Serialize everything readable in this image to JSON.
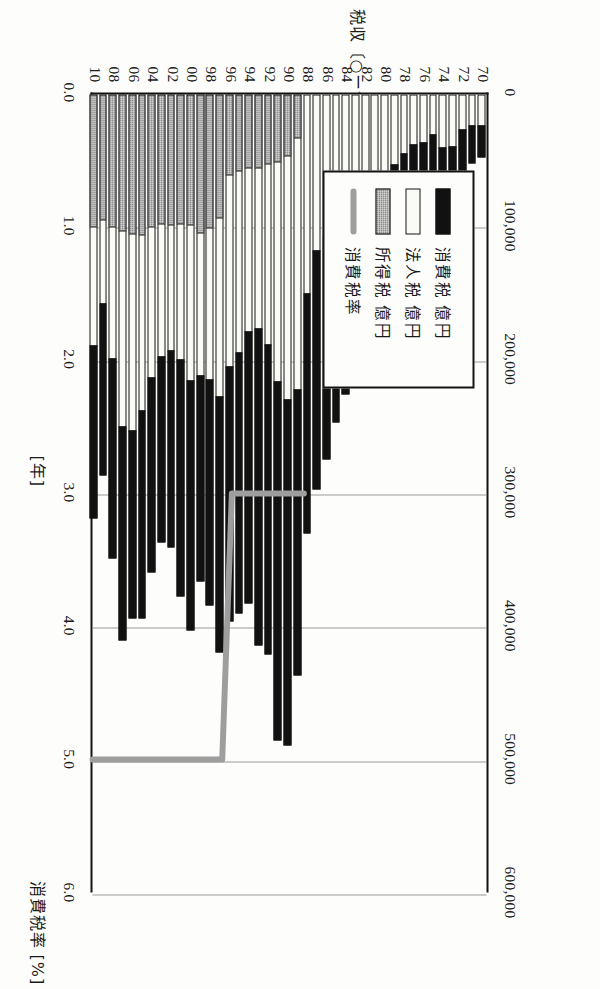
{
  "chart_data": {
    "type": "bar",
    "orientation": "vertical-stacked-with-line-overlay",
    "title": "",
    "xlabel": "[年]",
    "ylabel": "税収 〔○ー億円〕",
    "y2label": "消費税率 [%]",
    "ylim": [
      0,
      600000
    ],
    "y2lim": [
      0.0,
      6.0
    ],
    "yticks": [
      "0",
      "100,000",
      "200,000",
      "300,000",
      "400,000",
      "500,000",
      "600,000"
    ],
    "ytick_values": [
      0,
      100000,
      200000,
      300000,
      400000,
      500000,
      600000
    ],
    "y2ticks": [
      "0.0",
      "1.0",
      "2.0",
      "3.0",
      "4.0",
      "5.0",
      "6.0"
    ],
    "y2tick_values": [
      0.0,
      1.0,
      2.0,
      3.0,
      4.0,
      5.0,
      6.0
    ],
    "grid": true,
    "legend_position": "upper-left",
    "categories": [
      "70",
      "71",
      "72",
      "73",
      "74",
      "75",
      "76",
      "77",
      "78",
      "79",
      "80",
      "81",
      "82",
      "83",
      "84",
      "85",
      "86",
      "87",
      "88",
      "89",
      "90",
      "91",
      "92",
      "93",
      "94",
      "95",
      "96",
      "97",
      "98",
      "99",
      "00",
      "01",
      "02",
      "03",
      "04",
      "05",
      "06",
      "07",
      "08",
      "09",
      "10"
    ],
    "xtick_labels": [
      "70",
      "72",
      "74",
      "76",
      "78",
      "80",
      "82",
      "84",
      "86",
      "88",
      "90",
      "92",
      "94",
      "96",
      "98",
      "00",
      "02",
      "04",
      "06",
      "08",
      "10"
    ],
    "series": [
      {
        "name": "所得税 億円",
        "color": "#8e8e8e",
        "values": [
          24282,
          28471,
          35181,
          50140,
          62161,
          54823,
          64102,
          71444,
          85283,
          100144,
          107996,
          122881,
          129937,
          139133,
          149156,
          154350,
          168286,
          179167,
          179538,
          214279,
          259955,
          269653,
          231812,
          237905,
          204175,
          195151,
          190988,
          191827,
          169961,
          154468,
          187889,
          178065,
          148122,
          139141,
          146705,
          155859,
          140541,
          160800,
          149851,
          129139,
          129843
        ]
      },
      {
        "name": "法人税 億円",
        "color": "#fbfbf6",
        "values": [
          23711,
          24311,
          27174,
          40001,
          40129,
          31107,
          36730,
          38054,
          45250,
          52999,
          58945,
          68144,
          65589,
          70120,
          76348,
          92299,
          106171,
          117989,
          150165,
          189933,
          183836,
          165951,
          137136,
          121339,
          123631,
          137448,
          144833,
          134754,
          114232,
          107959,
          117472,
          102578,
          95234,
          101152,
          113820,
          132736,
          149179,
          147444,
          100106,
          63564,
          89677
        ]
      },
      {
        "name": "消費税 億円",
        "color": "#111111",
        "values": [
          0,
          0,
          0,
          0,
          0,
          0,
          0,
          0,
          0,
          0,
          0,
          0,
          0,
          0,
          0,
          0,
          0,
          0,
          0,
          32699,
          46227,
          50721,
          52221,
          55867,
          55616,
          57901,
          60564,
          93047,
          100744,
          104471,
          98221,
          97671,
          98115,
          97126,
          99743,
          105834,
          104633,
          102719,
          99686,
          94515,
          100000
        ]
      }
    ],
    "line_series": {
      "name": "消費税率",
      "color": "#9e9e9e",
      "unit": "%",
      "axis": "secondary",
      "values": [
        0,
        0,
        0,
        0,
        0,
        0,
        0,
        0,
        0,
        0,
        0,
        0,
        0,
        0,
        0,
        0,
        0,
        0,
        0,
        3.0,
        3.0,
        3.0,
        3.0,
        3.0,
        3.0,
        3.0,
        3.0,
        5.0,
        5.0,
        5.0,
        5.0,
        5.0,
        5.0,
        5.0,
        5.0,
        5.0,
        5.0,
        5.0,
        5.0,
        5.0,
        5.0
      ]
    }
  },
  "legend": {
    "items": [
      {
        "label": "消費税 億円",
        "swatch": "cons"
      },
      {
        "label": "法人税 億円",
        "swatch": "corp"
      },
      {
        "label": "所得税 億円",
        "swatch": "income"
      },
      {
        "label": "消費税率",
        "swatch": "rate"
      }
    ]
  },
  "axes": {
    "y_title_main": "税収",
    "y_title_unit": "〔○ー億円〕",
    "y_title_unit_open": "〔",
    "y_title_unit_circle": "○",
    "y_title_unit_dash": "ー",
    "y_title_unit_oku": "億",
    "y_title_unit_en": "円",
    "y_title_unit_close": "〕",
    "x_title": "[年]",
    "y2_title_main": "消費税率",
    "y2_title_unit": "[%]"
  },
  "colors": {
    "income": "#8e8e8e",
    "corporate": "#fbfbf6",
    "consumption": "#111111",
    "rate_line": "#9e9e9e",
    "axis": "#141414",
    "grid": "#9a9a9a",
    "background": "#fdfdfb"
  }
}
